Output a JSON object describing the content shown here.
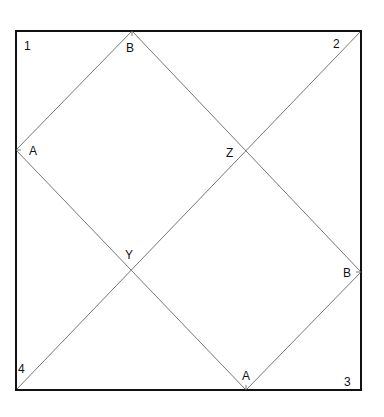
{
  "colors": {
    "frame": "#111111",
    "lines": "#777777",
    "text": "#111111",
    "background": "#ffffff"
  },
  "frame": {
    "x1": 16,
    "y1": 31,
    "x2": 361,
    "y2": 390
  },
  "corners": [
    {
      "label": "1",
      "x": 24,
      "y": 50
    },
    {
      "label": "2",
      "x": 333,
      "y": 48
    },
    {
      "label": "3",
      "x": 344,
      "y": 386
    },
    {
      "label": "4",
      "x": 18,
      "y": 373
    }
  ],
  "points": [
    {
      "label": "B",
      "x": 126,
      "y": 52
    },
    {
      "label": "A",
      "x": 29,
      "y": 155
    },
    {
      "label": "Z",
      "x": 226,
      "y": 157
    },
    {
      "label": "Y",
      "x": 125,
      "y": 259
    },
    {
      "label": "B",
      "x": 343,
      "y": 277
    },
    {
      "label": "A",
      "x": 242,
      "y": 380
    }
  ],
  "segments": [
    {
      "from": [
        16,
        150
      ],
      "to": [
        132,
        31
      ]
    },
    {
      "from": [
        132,
        31
      ],
      "to": [
        361,
        272
      ]
    },
    {
      "from": [
        16,
        150
      ],
      "to": [
        246,
        390
      ]
    },
    {
      "from": [
        246,
        390
      ],
      "to": [
        361,
        272
      ]
    },
    {
      "from": [
        16,
        390
      ],
      "to": [
        361,
        31
      ]
    }
  ]
}
